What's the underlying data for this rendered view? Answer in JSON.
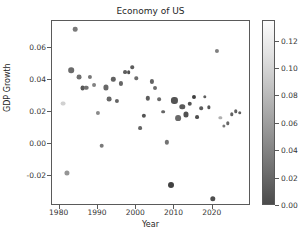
{
  "chart_data": {
    "type": "scatter",
    "title": "Economy of US",
    "xlabel": "Year",
    "ylabel": "GDP Growth",
    "xlim": [
      1978,
      2030
    ],
    "ylim": [
      -0.0385,
      0.0765
    ],
    "xticks": [
      "1980",
      "1990",
      "2000",
      "2010",
      "2020"
    ],
    "xtick_values": [
      1980,
      1990,
      2000,
      2010,
      2020
    ],
    "yticks": [
      "0.06",
      "0.04",
      "0.02",
      "0.00",
      "-0.02"
    ],
    "ytick_values": [
      0.06,
      0.04,
      0.02,
      0.0,
      -0.02
    ],
    "grid": false,
    "legend": null,
    "colorbar": {
      "label": "",
      "ticks": [
        "0.00",
        "0.02",
        "0.04",
        "0.06",
        "0.08",
        "0.10",
        "0.12"
      ],
      "tick_values": [
        0.0,
        0.02,
        0.04,
        0.06,
        0.08,
        0.1,
        0.12
      ],
      "vmin": 0.0,
      "vmax": 0.135,
      "colormap": "gray",
      "low_color": "#4b4b4b",
      "high_color": "#fcfcfc"
    },
    "encoding": {
      "x": "Year",
      "y": "GDP Growth",
      "color": "Inflation",
      "size": "Unemployment"
    },
    "points": [
      {
        "x": 1981,
        "y": 0.0252,
        "c": 0.1032,
        "s": 7.0
      },
      {
        "x": 1982,
        "y": -0.0179,
        "c": 0.0619,
        "s": 7.5
      },
      {
        "x": 1983,
        "y": 0.046,
        "c": 0.0322,
        "s": 8.5
      },
      {
        "x": 1984,
        "y": 0.0716,
        "c": 0.043,
        "s": 6.5
      },
      {
        "x": 1985,
        "y": 0.0417,
        "c": 0.0355,
        "s": 7.0
      },
      {
        "x": 1986,
        "y": 0.0348,
        "c": 0.019,
        "s": 7.0
      },
      {
        "x": 1987,
        "y": 0.0351,
        "c": 0.0364,
        "s": 6.5
      },
      {
        "x": 1988,
        "y": 0.0418,
        "c": 0.0408,
        "s": 5.5
      },
      {
        "x": 1989,
        "y": 0.0368,
        "c": 0.0482,
        "s": 5.0
      },
      {
        "x": 1990,
        "y": 0.0193,
        "c": 0.0538,
        "s": 5.5
      },
      {
        "x": 1991,
        "y": -0.0011,
        "c": 0.0423,
        "s": 6.5
      },
      {
        "x": 1992,
        "y": 0.0352,
        "c": 0.0303,
        "s": 7.5
      },
      {
        "x": 1993,
        "y": 0.028,
        "c": 0.0296,
        "s": 6.8
      },
      {
        "x": 1994,
        "y": 0.0403,
        "c": 0.0261,
        "s": 6.0
      },
      {
        "x": 1995,
        "y": 0.0268,
        "c": 0.0281,
        "s": 5.5
      },
      {
        "x": 1996,
        "y": 0.0377,
        "c": 0.0293,
        "s": 5.4
      },
      {
        "x": 1997,
        "y": 0.0445,
        "c": 0.0234,
        "s": 4.9
      },
      {
        "x": 1998,
        "y": 0.0449,
        "c": 0.0155,
        "s": 4.5
      },
      {
        "x": 1999,
        "y": 0.0479,
        "c": 0.0219,
        "s": 4.2
      },
      {
        "x": 2000,
        "y": 0.0408,
        "c": 0.0338,
        "s": 4.0
      },
      {
        "x": 2001,
        "y": 0.0101,
        "c": 0.0283,
        "s": 4.7
      },
      {
        "x": 2002,
        "y": 0.0174,
        "c": 0.0159,
        "s": 5.8
      },
      {
        "x": 2003,
        "y": 0.0285,
        "c": 0.0227,
        "s": 6.0
      },
      {
        "x": 2004,
        "y": 0.0389,
        "c": 0.0268,
        "s": 5.5
      },
      {
        "x": 2005,
        "y": 0.0348,
        "c": 0.0339,
        "s": 5.1
      },
      {
        "x": 2006,
        "y": 0.0278,
        "c": 0.0323,
        "s": 4.6
      },
      {
        "x": 2007,
        "y": 0.0201,
        "c": 0.0285,
        "s": 4.6
      },
      {
        "x": 2008,
        "y": 0.0011,
        "c": 0.0384,
        "s": 5.8
      },
      {
        "x": 2009,
        "y": -0.0255,
        "c": 0.0036,
        "s": 9.3
      },
      {
        "x": 2010,
        "y": 0.0271,
        "c": 0.0164,
        "s": 9.6
      },
      {
        "x": 2011,
        "y": 0.0159,
        "c": 0.0316,
        "s": 8.9
      },
      {
        "x": 2012,
        "y": 0.023,
        "c": 0.0207,
        "s": 8.1
      },
      {
        "x": 2013,
        "y": 0.0184,
        "c": 0.0146,
        "s": 7.4
      },
      {
        "x": 2014,
        "y": 0.0252,
        "c": 0.0162,
        "s": 6.2
      },
      {
        "x": 2015,
        "y": 0.0295,
        "c": 0.0012,
        "s": 5.3
      },
      {
        "x": 2016,
        "y": 0.0167,
        "c": 0.0126,
        "s": 4.9
      },
      {
        "x": 2017,
        "y": 0.0224,
        "c": 0.0213,
        "s": 4.4
      },
      {
        "x": 2018,
        "y": 0.0295,
        "c": 0.0244,
        "s": 3.9
      },
      {
        "x": 2019,
        "y": 0.0229,
        "c": 0.0181,
        "s": 3.7
      },
      {
        "x": 2020,
        "y": -0.0341,
        "c": 0.0123,
        "s": 8.1
      },
      {
        "x": 2021,
        "y": 0.0577,
        "c": 0.047,
        "s": 5.4
      },
      {
        "x": 2022,
        "y": 0.0165,
        "c": 0.08,
        "s": 3.7
      },
      {
        "x": 2023,
        "y": 0.0114,
        "c": 0.0412,
        "s": 3.6
      },
      {
        "x": 2024,
        "y": 0.0129,
        "c": 0.0295,
        "s": 4.0
      },
      {
        "x": 2025,
        "y": 0.0184,
        "c": 0.026,
        "s": 4.1
      },
      {
        "x": 2026,
        "y": 0.0203,
        "c": 0.0248,
        "s": 4.2
      },
      {
        "x": 2027,
        "y": 0.0196,
        "c": 0.024,
        "s": 4.2
      }
    ]
  }
}
